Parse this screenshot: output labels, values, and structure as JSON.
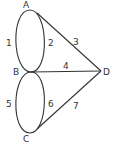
{
  "diagram": {
    "type": "graph",
    "colors": {
      "stroke": "#333333",
      "text": "#333333",
      "background": "#ffffff"
    },
    "nodes": {
      "A": {
        "label": "A",
        "x": 30,
        "y": 10
      },
      "B": {
        "label": "B",
        "x": 31,
        "y": 72
      },
      "C": {
        "label": "C",
        "x": 30,
        "y": 133
      },
      "D": {
        "label": "D",
        "x": 101,
        "y": 71
      }
    },
    "edges": [
      {
        "id": "1",
        "label": "1",
        "from": "A",
        "to": "B",
        "shape": "left arc"
      },
      {
        "id": "2",
        "label": "2",
        "from": "A",
        "to": "B",
        "shape": "right arc"
      },
      {
        "id": "3",
        "label": "3",
        "from": "A",
        "to": "D",
        "shape": "line"
      },
      {
        "id": "4",
        "label": "4",
        "from": "B",
        "to": "D",
        "shape": "line"
      },
      {
        "id": "5",
        "label": "5",
        "from": "B",
        "to": "C",
        "shape": "left arc"
      },
      {
        "id": "6",
        "label": "6",
        "from": "B",
        "to": "C",
        "shape": "right arc"
      },
      {
        "id": "7",
        "label": "7",
        "from": "C",
        "to": "D",
        "shape": "line"
      }
    ]
  }
}
